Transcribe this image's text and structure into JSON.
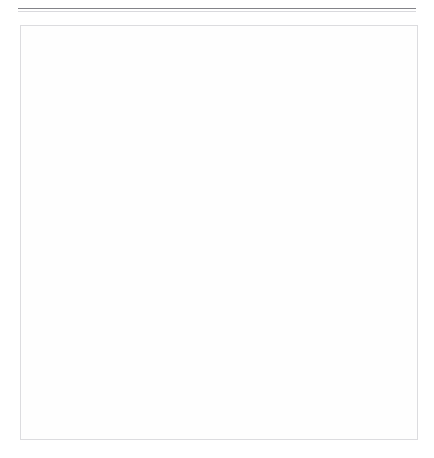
{
  "chart_data": {
    "type": "bar",
    "title": "",
    "subtitle": "",
    "categories": [
      "Englisch",
      "Englisch&Deutsch",
      "Deutsch",
      "Chinesisch",
      "-",
      "Finnisch"
    ],
    "series": [
      {
        "name": "Absolute Anzahl",
        "axis": "top",
        "ylabel": "Absolute Anzahl",
        "values": [
          174,
          22,
          9,
          2,
          2,
          1
        ],
        "value_labels": [
          "174",
          "22",
          "9",
          "2",
          "2",
          "1"
        ],
        "ylim": [
          0,
          200
        ],
        "yticks": [
          0,
          50,
          100,
          150,
          200
        ],
        "ytick_labels": [
          "0",
          "50",
          "100",
          "150",
          "200"
        ],
        "direction": "up"
      },
      {
        "name": "Prozentualer Anteil",
        "axis": "bottom",
        "ylabel": "Prozentualer Anteil",
        "values": [
          82.86,
          10.48,
          4.29,
          0.95,
          0.95,
          0.48
        ],
        "value_labels": [
          "82,86%",
          "10,48%",
          "4,29%",
          "0,95%",
          "0,95%",
          "0,48%"
        ],
        "ylim": [
          0,
          100
        ],
        "yticks": [
          0,
          20,
          40,
          60,
          80,
          100
        ],
        "ytick_labels": [
          "0%",
          "20%",
          "40%",
          "60%",
          "80%",
          "100%"
        ],
        "direction": "down"
      }
    ],
    "xlabel": "",
    "grid": true,
    "legend": "none",
    "bar_color": "#7f7f7f",
    "gridline_color": "#e9e9ec",
    "frame_color": "#dcdcdf"
  }
}
